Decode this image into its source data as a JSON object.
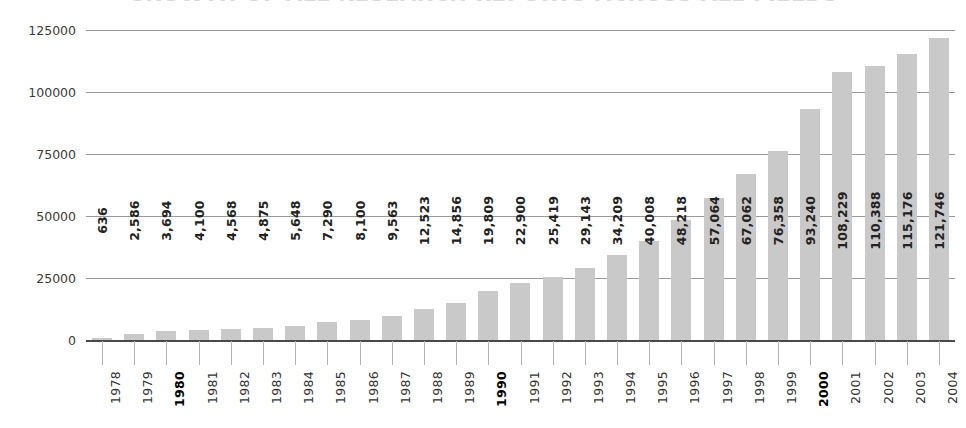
{
  "title": "GROWTH OF ALL RESEARCH REPORTS ACROSS ALL FIELDS",
  "colors": {
    "bar": "#c9c9c9",
    "gridline": "#9a9a9a",
    "baseline": "#4a4a4a",
    "label_text": "#222222",
    "axis_text": "#333333"
  },
  "chart_data": {
    "type": "bar",
    "title": "GROWTH OF ALL RESEARCH REPORTS ACROSS ALL FIELDS",
    "xlabel": "",
    "ylabel": "",
    "ylim": [
      0,
      125000
    ],
    "yticks": [
      0,
      25000,
      50000,
      75000,
      100000,
      125000
    ],
    "ytick_labels": [
      "0",
      "25000",
      "50000",
      "75000",
      "100000",
      "125000"
    ],
    "grid": true,
    "legend": false,
    "categories": [
      "1978",
      "1979",
      "1980",
      "1981",
      "1982",
      "1983",
      "1984",
      "1985",
      "1986",
      "1987",
      "1988",
      "1989",
      "1990",
      "1991",
      "1992",
      "1993",
      "1994",
      "1995",
      "1996",
      "1997",
      "1998",
      "1999",
      "2000",
      "2001",
      "2002",
      "2003",
      "2004"
    ],
    "emphasized_categories": [
      "1980",
      "1990",
      "2000"
    ],
    "values": [
      636,
      2586,
      3694,
      4100,
      4568,
      4875,
      5648,
      7290,
      8100,
      9563,
      12523,
      14856,
      19809,
      22900,
      25419,
      29143,
      34209,
      40008,
      48218,
      57064,
      67062,
      76358,
      93240,
      108229,
      110388,
      115176,
      121746
    ],
    "value_labels": [
      "636",
      "2,586",
      "3,694",
      "4,100",
      "4,568",
      "4,875",
      "5,648",
      "7,290",
      "8,100",
      "9,563",
      "12,523",
      "14,856",
      "19,809",
      "22,900",
      "25,419",
      "29,143",
      "34,209",
      "40,008",
      "48,218",
      "57,064",
      "67,062",
      "76,358",
      "93,240",
      "108,229",
      "110,388",
      "115,176",
      "121,746"
    ]
  }
}
